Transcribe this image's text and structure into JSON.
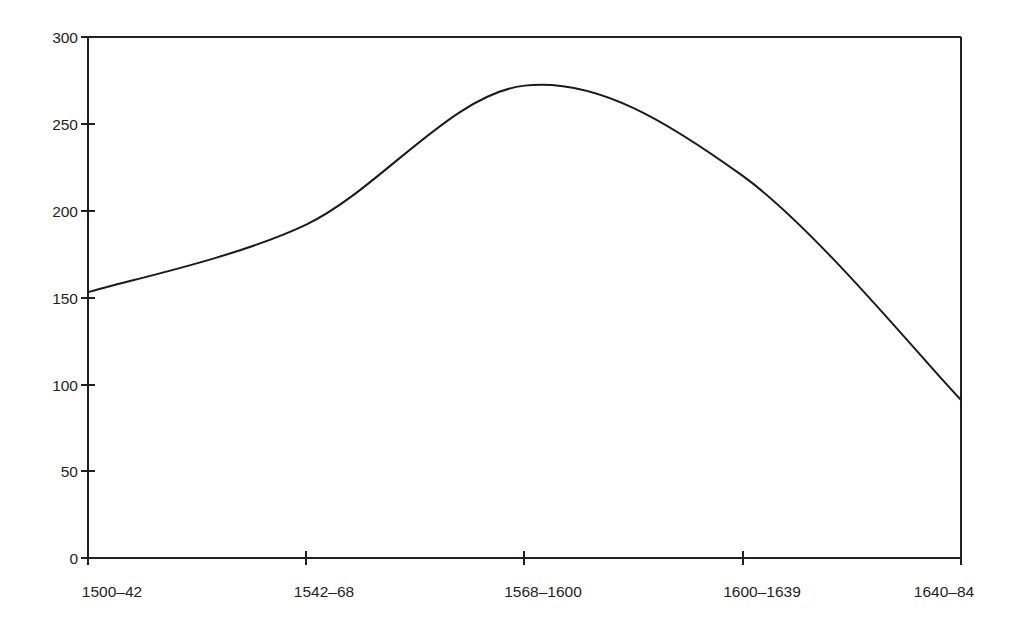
{
  "chart_data": {
    "type": "line",
    "title": "",
    "subtitle": "",
    "xlabel": "",
    "ylabel": "",
    "categories": [
      "1500–42",
      "1542–68",
      "1568–1600",
      "1600–1639",
      "1640–84"
    ],
    "values": [
      153,
      192,
      272,
      220,
      91
    ],
    "series": [
      {
        "name": "",
        "values": [
          153,
          192,
          272,
          220,
          91
        ]
      }
    ],
    "smoothing": "spline",
    "peak_value": 279,
    "ylim": [
      0,
      300
    ],
    "ytick_values": [
      0,
      50,
      100,
      150,
      200,
      250,
      300
    ],
    "ytick_labels": [
      "0",
      "50",
      "100",
      "150",
      "200",
      "250",
      "300"
    ],
    "xtick_labels": [
      "1500–42",
      "1542–68",
      "1568–1600",
      "1600–1639",
      "1640–84"
    ],
    "grid": false,
    "legend": "none",
    "line_color": "#1a1a1a",
    "axis_color": "#231f20",
    "background_color": "#ffffff"
  },
  "axes": {
    "y": {
      "ticks": [
        {
          "label": "300",
          "value": 300
        },
        {
          "label": "250",
          "value": 250
        },
        {
          "label": "200",
          "value": 200
        },
        {
          "label": "150",
          "value": 150
        },
        {
          "label": "100",
          "value": 100
        },
        {
          "label": "50",
          "value": 50
        },
        {
          "label": "0",
          "value": 0
        }
      ]
    },
    "x": {
      "ticks": [
        {
          "label": "1500–42"
        },
        {
          "label": "1542–68"
        },
        {
          "label": "1568–1600"
        },
        {
          "label": "1600–1639"
        },
        {
          "label": "1640–84"
        }
      ]
    }
  }
}
